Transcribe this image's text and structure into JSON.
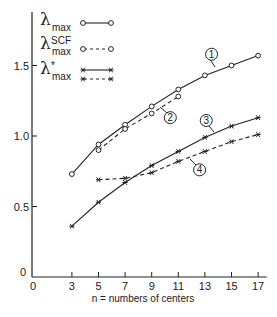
{
  "chart_data": {
    "type": "line",
    "title": "",
    "xlabel": "n = numbers of centers",
    "ylabel": "",
    "xlim": [
      0,
      17.5
    ],
    "ylim": [
      0,
      1.7
    ],
    "x_ticks": [
      0,
      3,
      5,
      7,
      9,
      11,
      13,
      15,
      17
    ],
    "x_tick_labels": [
      "0",
      "3",
      "5",
      "7",
      "9",
      "11",
      "13",
      "15",
      "17"
    ],
    "y_ticks": [
      0,
      0.5,
      1.0,
      1.5
    ],
    "y_tick_labels": [
      "0",
      "0.5",
      "1.0",
      "1.5"
    ],
    "grid": false,
    "legend_position": "top-left",
    "legend": [
      {
        "symbol": "λ",
        "sup": "",
        "sub": "max",
        "styles": [
          "solid-circle"
        ]
      },
      {
        "symbol": "λ",
        "sup": "SCF",
        "sub": "max",
        "styles": [
          "dashed-circle"
        ]
      },
      {
        "symbol": "λ",
        "sup": "*",
        "sub": "max",
        "styles": [
          "solid-star",
          "dashed-star"
        ]
      }
    ],
    "series": [
      {
        "name": "λmax",
        "label": "1",
        "line": "solid",
        "marker": "circle",
        "x": [
          3,
          5,
          7,
          9,
          11,
          13,
          15,
          17
        ],
        "values": [
          0.73,
          0.94,
          1.08,
          1.21,
          1.33,
          1.43,
          1.5,
          1.57
        ]
      },
      {
        "name": "λmax SCF",
        "label": "2",
        "line": "dashed",
        "marker": "circle",
        "x": [
          5,
          7,
          9,
          11
        ],
        "values": [
          0.9,
          1.05,
          1.16,
          1.28
        ]
      },
      {
        "name": "λ*max (solid)",
        "label": "3",
        "line": "solid",
        "marker": "star",
        "x": [
          3,
          5,
          7,
          9,
          11,
          13,
          15,
          17
        ],
        "values": [
          0.36,
          0.53,
          0.67,
          0.79,
          0.89,
          0.99,
          1.07,
          1.13
        ]
      },
      {
        "name": "λ*max (dashed)",
        "label": "4",
        "line": "dashed",
        "marker": "star",
        "x": [
          5,
          7,
          9,
          11,
          13,
          15,
          17
        ],
        "values": [
          0.69,
          0.7,
          0.74,
          0.82,
          0.89,
          0.96,
          1.01
        ]
      }
    ],
    "curve_labels": [
      {
        "text": "1",
        "at_x": 13.5,
        "at_y": 1.58
      },
      {
        "text": "2",
        "at_x": 10.4,
        "at_y": 1.13
      },
      {
        "text": "3",
        "at_x": 13.1,
        "at_y": 1.11
      },
      {
        "text": "4",
        "at_x": 12.6,
        "at_y": 0.76
      }
    ],
    "origin_labels": {
      "y": "0",
      "x": "0"
    }
  }
}
